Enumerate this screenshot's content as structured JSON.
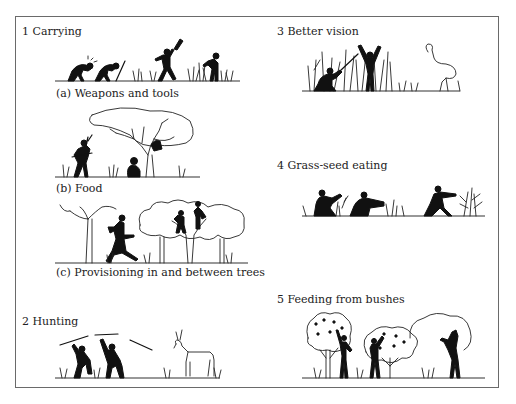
{
  "figure": {
    "panels": [
      {
        "number": "1",
        "title": "1  Carrying",
        "subpanels": [
          {
            "label": "(a)  Weapons and tools",
            "scene": "two crouching figures and a figure raising a club among grass"
          },
          {
            "label": "(b)  Food",
            "scene": "figure carrying food, seated figure, figure in a large tree"
          },
          {
            "label": "(c)  Provisioning in and between trees",
            "scene": "running figure between trees, two figures climbing in canopy"
          }
        ]
      },
      {
        "number": "2",
        "title": "2  Hunting",
        "scene": "two figures throwing spears at an antelope"
      },
      {
        "number": "3",
        "title": "3  Better vision",
        "scene": "crouching figure in tall grass, standing figure with arms raised, ostrich-like bird"
      },
      {
        "number": "4",
        "title": "4  Grass-seed eating",
        "scene": "two seated figures reaching into grass, walking figure near grass clump"
      },
      {
        "number": "5",
        "title": "5  Feeding from bushes",
        "scene": "two figures reaching into fruiting bushes, animal standing on hind legs at a bush"
      }
    ]
  }
}
